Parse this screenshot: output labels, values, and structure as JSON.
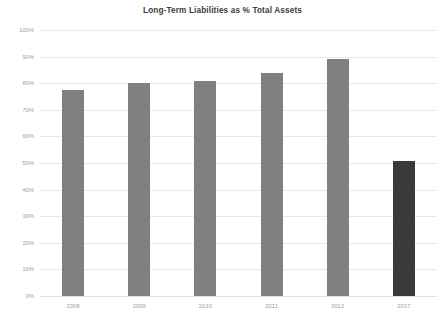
{
  "chart_data": {
    "type": "bar",
    "title": "Long-Term Liabilities as % Total Assets",
    "xlabel": "",
    "ylabel": "",
    "categories": [
      "2008",
      "2009",
      "2010",
      "2011",
      "2012",
      "2017"
    ],
    "values": [
      77.5,
      80.0,
      80.8,
      84.0,
      89.0,
      50.8
    ],
    "ylim": [
      0,
      100
    ],
    "y_ticks": [
      0,
      10,
      20,
      30,
      40,
      50,
      60,
      70,
      80,
      90,
      100
    ],
    "y_tick_labels": [
      "0%",
      "10%",
      "20%",
      "30%",
      "40%",
      "50%",
      "60%",
      "70%",
      "80%",
      "90%",
      "100%"
    ],
    "grid": true,
    "legend": false,
    "bar_colors": [
      "#808080",
      "#808080",
      "#808080",
      "#808080",
      "#808080",
      "#3a3a3a"
    ],
    "highlight_category": "2017",
    "colors": {
      "default_bar": "#808080",
      "highlight_bar": "#3a3a3a",
      "gridline": "#e8e8e8",
      "axis_line": "#e0e0e0",
      "tick_text": "#9a9a9a",
      "title_text": "#3b3b3b",
      "background": "#ffffff"
    }
  }
}
